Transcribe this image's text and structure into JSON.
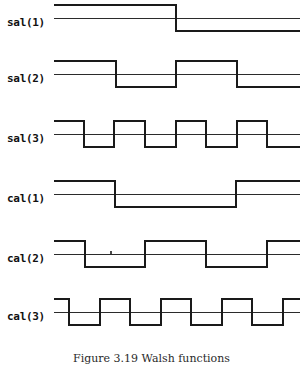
{
  "figure": {
    "caption": "Figure 3.19  Walsh functions",
    "caption_x": 0,
    "caption_y": 352,
    "width": 303,
    "height": 367,
    "background": "#ffffff",
    "stroke_color": "#1a1a1a",
    "baseline_color": "#2b2b2b",
    "plot_x_start": 54,
    "plot_x_end": 300,
    "stroke_width": 1.6,
    "baseline_width": 1.0
  },
  "artifacts": [
    {
      "name": "speck-mark",
      "x": 110,
      "y": 251,
      "width": 2,
      "height": 3,
      "color": "#4a4a4a"
    }
  ],
  "chart_data": {
    "type": "line",
    "title": "Figure 3.19  Walsh functions",
    "xlabel": "",
    "ylabel": "",
    "grid": false,
    "legend": "none",
    "x_range": [
      0,
      1
    ],
    "y_range": [
      -1,
      1
    ],
    "series": [
      {
        "name": "sal(1)",
        "label": "sal(1)",
        "row_top": 2,
        "row_height": 52,
        "label_y": 14,
        "baseline_y": 16,
        "high_y": 3,
        "low_y": 29,
        "transitions_px": [
          176
        ],
        "levels": [
          1,
          -1
        ],
        "segments": [
          {
            "x0": 54,
            "x1": 176,
            "level": 1
          },
          {
            "x0": 176,
            "x1": 300,
            "level": -1
          }
        ]
      },
      {
        "name": "sal(2)",
        "label": "sal(2)",
        "row_top": 58,
        "row_height": 52,
        "label_y": 14,
        "baseline_y": 16,
        "high_y": 3,
        "low_y": 29,
        "transitions_px": [
          116,
          176,
          237
        ],
        "levels": [
          1,
          -1,
          1,
          -1
        ],
        "segments": [
          {
            "x0": 54,
            "x1": 116,
            "level": 1
          },
          {
            "x0": 116,
            "x1": 176,
            "level": -1
          },
          {
            "x0": 176,
            "x1": 237,
            "level": 1
          },
          {
            "x0": 237,
            "x1": 300,
            "level": -1
          }
        ]
      },
      {
        "name": "sal(3)",
        "label": "sal(3)",
        "row_top": 118,
        "row_height": 52,
        "label_y": 14,
        "baseline_y": 16,
        "high_y": 3,
        "low_y": 29,
        "transitions_px": [
          84,
          114,
          145,
          176,
          206,
          237,
          267
        ],
        "levels": [
          1,
          -1,
          1,
          -1,
          1,
          -1,
          1,
          -1
        ],
        "segments": [
          {
            "x0": 54,
            "x1": 84,
            "level": 1
          },
          {
            "x0": 84,
            "x1": 114,
            "level": -1
          },
          {
            "x0": 114,
            "x1": 145,
            "level": 1
          },
          {
            "x0": 145,
            "x1": 176,
            "level": -1
          },
          {
            "x0": 176,
            "x1": 206,
            "level": 1
          },
          {
            "x0": 206,
            "x1": 237,
            "level": -1
          },
          {
            "x0": 237,
            "x1": 267,
            "level": 1
          },
          {
            "x0": 267,
            "x1": 300,
            "level": -1
          }
        ]
      },
      {
        "name": "cal(1)",
        "label": "cal(1)",
        "row_top": 178,
        "row_height": 52,
        "label_y": 14,
        "baseline_y": 16,
        "high_y": 3,
        "low_y": 29,
        "transitions_px": [
          115,
          236
        ],
        "levels": [
          1,
          -1,
          1
        ],
        "segments": [
          {
            "x0": 54,
            "x1": 115,
            "level": 1
          },
          {
            "x0": 115,
            "x1": 236,
            "level": -1
          },
          {
            "x0": 236,
            "x1": 300,
            "level": 1
          }
        ]
      },
      {
        "name": "cal(2)",
        "label": "cal(2)",
        "row_top": 238,
        "row_height": 52,
        "label_y": 14,
        "baseline_y": 16,
        "high_y": 3,
        "low_y": 29,
        "transitions_px": [
          85,
          145,
          206,
          267
        ],
        "levels": [
          1,
          -1,
          1,
          -1,
          1
        ],
        "segments": [
          {
            "x0": 54,
            "x1": 85,
            "level": 1
          },
          {
            "x0": 85,
            "x1": 145,
            "level": -1
          },
          {
            "x0": 145,
            "x1": 206,
            "level": 1
          },
          {
            "x0": 206,
            "x1": 267,
            "level": -1
          },
          {
            "x0": 267,
            "x1": 300,
            "level": 1
          }
        ]
      },
      {
        "name": "cal(3)",
        "label": "cal(3)",
        "row_top": 296,
        "row_height": 52,
        "label_y": 14,
        "baseline_y": 16,
        "high_y": 3,
        "low_y": 29,
        "transitions_px": [
          69,
          100,
          130,
          161,
          191,
          222,
          252,
          283
        ],
        "levels": [
          1,
          -1,
          1,
          -1,
          1,
          -1,
          1,
          -1,
          1
        ],
        "segments": [
          {
            "x0": 54,
            "x1": 69,
            "level": 1
          },
          {
            "x0": 69,
            "x1": 100,
            "level": -1
          },
          {
            "x0": 100,
            "x1": 130,
            "level": 1
          },
          {
            "x0": 130,
            "x1": 161,
            "level": -1
          },
          {
            "x0": 161,
            "x1": 191,
            "level": 1
          },
          {
            "x0": 191,
            "x1": 222,
            "level": -1
          },
          {
            "x0": 222,
            "x1": 252,
            "level": 1
          },
          {
            "x0": 252,
            "x1": 283,
            "level": -1
          },
          {
            "x0": 283,
            "x1": 300,
            "level": 1
          }
        ]
      }
    ]
  }
}
